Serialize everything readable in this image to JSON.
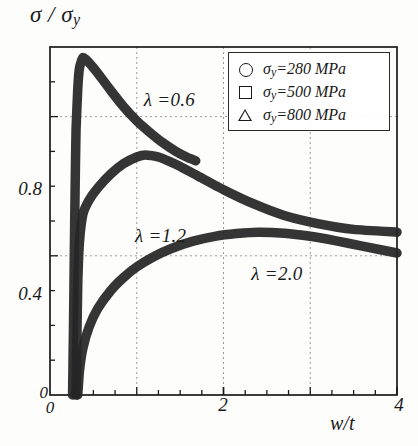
{
  "chart_data": {
    "type": "line",
    "title": "",
    "xlabel": "w/t",
    "ylabel": "σ / σy",
    "xlim": [
      0,
      4
    ],
    "ylim": [
      0,
      1
    ],
    "x_ticks": [
      "0",
      "2",
      "4"
    ],
    "x_tick_values": [
      0,
      2,
      4
    ],
    "y_ticks": [
      "0",
      "0.4",
      "0.8"
    ],
    "y_tick_values": [
      0,
      0.4,
      0.8
    ],
    "x_gridlines": [
      1,
      2,
      3
    ],
    "y_gridlines": [
      0.4,
      0.8
    ],
    "grid": "dashed",
    "legend_position": "top-right",
    "series": [
      {
        "name": "λ =0.6",
        "label": "λ =0.6",
        "peak_x": 0.38,
        "peak_y": 0.97,
        "points": [
          [
            0.26,
            0.0
          ],
          [
            0.27,
            0.18
          ],
          [
            0.28,
            0.4
          ],
          [
            0.29,
            0.6
          ],
          [
            0.3,
            0.76
          ],
          [
            0.32,
            0.88
          ],
          [
            0.34,
            0.94
          ],
          [
            0.38,
            0.97
          ],
          [
            0.45,
            0.955
          ],
          [
            0.55,
            0.925
          ],
          [
            0.7,
            0.875
          ],
          [
            0.85,
            0.828
          ],
          [
            1.0,
            0.788
          ],
          [
            1.15,
            0.755
          ],
          [
            1.3,
            0.725
          ],
          [
            1.45,
            0.7
          ],
          [
            1.58,
            0.683
          ],
          [
            1.68,
            0.673
          ]
        ]
      },
      {
        "name": "λ =1.2",
        "label": "λ =1.2",
        "peak_x": 1.1,
        "peak_y": 0.69,
        "points": [
          [
            0.3,
            0.0
          ],
          [
            0.31,
            0.16
          ],
          [
            0.32,
            0.32
          ],
          [
            0.34,
            0.44
          ],
          [
            0.38,
            0.52
          ],
          [
            0.45,
            0.56
          ],
          [
            0.55,
            0.595
          ],
          [
            0.7,
            0.635
          ],
          [
            0.85,
            0.665
          ],
          [
            1.0,
            0.684
          ],
          [
            1.1,
            0.69
          ],
          [
            1.25,
            0.684
          ],
          [
            1.45,
            0.663
          ],
          [
            1.7,
            0.63
          ],
          [
            2.0,
            0.59
          ],
          [
            2.35,
            0.549
          ],
          [
            2.7,
            0.516
          ],
          [
            3.1,
            0.492
          ],
          [
            3.5,
            0.476
          ],
          [
            4.0,
            0.468
          ]
        ]
      },
      {
        "name": "λ =2.0",
        "label": "λ =2.0",
        "peak_x": 2.4,
        "peak_y": 0.468,
        "points": [
          [
            0.32,
            0.0
          ],
          [
            0.34,
            0.07
          ],
          [
            0.38,
            0.135
          ],
          [
            0.45,
            0.195
          ],
          [
            0.55,
            0.248
          ],
          [
            0.7,
            0.3
          ],
          [
            0.85,
            0.338
          ],
          [
            1.0,
            0.368
          ],
          [
            1.2,
            0.398
          ],
          [
            1.4,
            0.421
          ],
          [
            1.65,
            0.442
          ],
          [
            1.9,
            0.456
          ],
          [
            2.15,
            0.464
          ],
          [
            2.4,
            0.468
          ],
          [
            2.7,
            0.465
          ],
          [
            3.0,
            0.456
          ],
          [
            3.3,
            0.443
          ],
          [
            3.6,
            0.428
          ],
          [
            4.0,
            0.408
          ]
        ]
      }
    ],
    "annotations": [
      {
        "text": "λ =0.6",
        "x": 1.08,
        "y": 0.845
      },
      {
        "text": "λ =1.2",
        "x": 0.98,
        "y": 0.455
      },
      {
        "text": "λ =2.0",
        "x": 2.32,
        "y": 0.345
      }
    ],
    "legend": {
      "entries": [
        {
          "marker": "circle",
          "symbol": "σ",
          "sub": "y",
          "text": "=280 MPa"
        },
        {
          "marker": "square",
          "symbol": "σ",
          "sub": "y",
          "text": "=500 MPa"
        },
        {
          "marker": "triangle",
          "symbol": "σ",
          "sub": "y",
          "text": "=800 MPa"
        }
      ]
    },
    "colors": {
      "curve": "#262626",
      "axis": "#1a1a1a",
      "grid": "#9a9a9a",
      "background": "#fdfdfc"
    }
  }
}
